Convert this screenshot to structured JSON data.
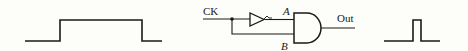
{
  "diagram": {
    "colors": {
      "stroke": "#1a1a1a",
      "background": "#fdfdf9"
    },
    "input_waveform": {
      "label": "",
      "description": "wide square pulse (clock input)"
    },
    "circuit": {
      "input_label": "CK",
      "node_a_label": "A",
      "node_b_label": "B",
      "output_label": "Out",
      "components": [
        "junction-dot",
        "inverter",
        "and-gate"
      ]
    },
    "output_waveform": {
      "label": "",
      "description": "narrow pulse (output)"
    }
  }
}
